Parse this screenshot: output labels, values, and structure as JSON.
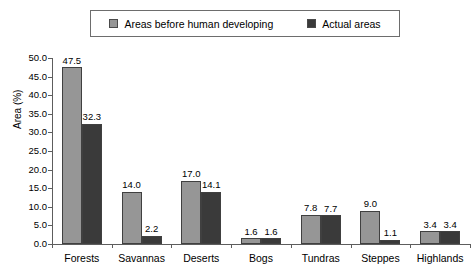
{
  "chart_data": {
    "type": "bar",
    "title": "",
    "xlabel": "",
    "ylabel": "Area (%)",
    "ylim": [
      0,
      50
    ],
    "ytick_step": 5,
    "grid": false,
    "legend_position": "top",
    "categories": [
      "Forests",
      "Savannas",
      "Deserts",
      "Bogs",
      "Tundras",
      "Steppes",
      "Highlands"
    ],
    "series": [
      {
        "name": "Areas before human developing",
        "color": "#969696",
        "values": [
          47.5,
          14.0,
          17.0,
          1.6,
          7.8,
          9.0,
          3.4
        ]
      },
      {
        "name": "Actual areas",
        "color": "#3a3a3a",
        "values": [
          32.3,
          2.2,
          14.1,
          1.6,
          7.7,
          1.1,
          3.4
        ]
      }
    ],
    "value_labels": [
      [
        "47.5",
        "32.3"
      ],
      [
        "14.0",
        "2.2"
      ],
      [
        "17.0",
        "14.1"
      ],
      [
        "1.6",
        "1.6"
      ],
      [
        "7.8",
        "7.7"
      ],
      [
        "9.0",
        "1.1"
      ],
      [
        "3.4",
        "3.4"
      ]
    ],
    "ytick_labels": [
      "0.0",
      "5.0",
      "10.0",
      "15.0",
      "20.0",
      "25.0",
      "30.0",
      "35.0",
      "40.0",
      "45.0",
      "50.0"
    ]
  },
  "legend": {
    "entries": [
      {
        "label": "Areas before human developing",
        "color": "#969696"
      },
      {
        "label": "Actual areas",
        "color": "#3a3a3a"
      }
    ]
  },
  "colors": {
    "series_light": "#969696",
    "series_dark": "#3a3a3a",
    "axis": "#5d5d5d",
    "background": "#ffffff"
  }
}
